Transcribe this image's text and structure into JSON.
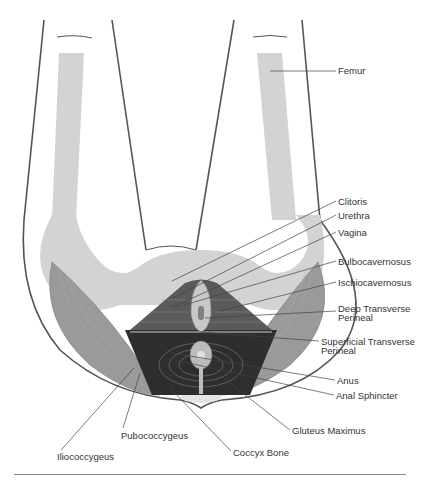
{
  "diagram": {
    "labels": [
      {
        "id": "femur",
        "text": "Femur",
        "x": 338,
        "y": 66
      },
      {
        "id": "clitoris",
        "text": "Clitoris",
        "x": 338,
        "y": 197
      },
      {
        "id": "urethra",
        "text": "Urethra",
        "x": 338,
        "y": 211
      },
      {
        "id": "vagina",
        "text": "Vagina",
        "x": 338,
        "y": 228
      },
      {
        "id": "bulbocavernosus",
        "text": "Bulbocavernosus",
        "x": 338,
        "y": 257
      },
      {
        "id": "ischiocavernosus",
        "text": "Ischiocavernosus",
        "x": 338,
        "y": 278
      },
      {
        "id": "deep-transverse-perineal-1",
        "text": "Deep Transverse",
        "x": 338,
        "y": 304
      },
      {
        "id": "deep-transverse-perineal-2",
        "text": "Perineal",
        "x": 338,
        "y": 313
      },
      {
        "id": "superficial-transverse-perineal-1",
        "text": "Superficial Transverse",
        "x": 321,
        "y": 337
      },
      {
        "id": "superficial-transverse-perineal-2",
        "text": "Perineal",
        "x": 321,
        "y": 346
      },
      {
        "id": "anus",
        "text": "Anus",
        "x": 337,
        "y": 376
      },
      {
        "id": "anal-sphincter",
        "text": "Anal Sphincter",
        "x": 336,
        "y": 391
      },
      {
        "id": "gluteus-maximus",
        "text": "Gluteus Maximus",
        "x": 292,
        "y": 426
      },
      {
        "id": "pubococcygeus",
        "text": "Pubococcygeus",
        "x": 121,
        "y": 431
      },
      {
        "id": "coccyx-bone",
        "text": "Coccyx Bone",
        "x": 233,
        "y": 448
      },
      {
        "id": "iliococcygeus",
        "text": "Iliococcygeus",
        "x": 57,
        "y": 452
      }
    ]
  },
  "colors": {
    "bone": "#d3d3d3",
    "gluteus": "#9a9a9a",
    "muscle_dark": "#3a3a3a",
    "muscle_mid": "#6e6e6e",
    "outline": "#555555",
    "leader": "#444444",
    "text": "#333333"
  }
}
